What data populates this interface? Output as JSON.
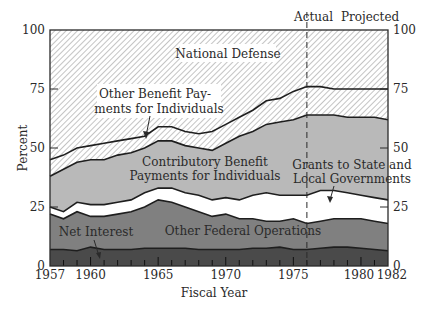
{
  "chart_data": {
    "type": "area",
    "stacked": true,
    "title": "",
    "xlabel": "Fiscal Year",
    "ylabel": "Percent",
    "xlim": [
      1957,
      1982
    ],
    "ylim": [
      0,
      100
    ],
    "x_ticks": [
      1957,
      1960,
      1965,
      1970,
      1975,
      1980,
      1982
    ],
    "y_ticks": [
      0,
      25,
      50,
      75,
      100
    ],
    "y_ticks_right": [
      0,
      25,
      50,
      75,
      100
    ],
    "grid": false,
    "legend_position": "inline labels",
    "divider": {
      "year": 1976,
      "left_label": "Actual",
      "right_label": "Projected"
    },
    "x": [
      1957,
      1958,
      1959,
      1960,
      1961,
      1962,
      1963,
      1964,
      1965,
      1966,
      1967,
      1968,
      1969,
      1970,
      1971,
      1972,
      1973,
      1974,
      1975,
      1976,
      1977,
      1978,
      1979,
      1980,
      1981,
      1982
    ],
    "cumulative_tops": {
      "Net Interest": [
        7,
        7,
        6.5,
        8,
        7,
        7,
        7,
        7.5,
        7.5,
        7.5,
        7.5,
        7,
        7,
        7,
        7,
        7.5,
        7.5,
        8,
        7,
        7,
        7.5,
        8,
        8,
        7.5,
        7,
        6.5
      ],
      "Other Federal Operations": [
        22,
        20,
        23,
        21,
        21,
        22,
        23,
        25,
        28,
        27,
        25,
        23,
        21,
        22,
        20,
        20,
        19,
        19,
        20,
        18,
        19,
        20,
        20,
        20,
        19,
        18
      ],
      "Grants to State and Local Governments": [
        25,
        23,
        27,
        26,
        26,
        27,
        28,
        31,
        33,
        33,
        31,
        30,
        28,
        29,
        28,
        30,
        31,
        30,
        30,
        30,
        32,
        32,
        31,
        30,
        29,
        28
      ],
      "Contributory Benefit Payments for Individuals": [
        38,
        41,
        44,
        45,
        45,
        47,
        48,
        50,
        53,
        53,
        51,
        50,
        49,
        52,
        55,
        57,
        60,
        61,
        62,
        64,
        64,
        64,
        63,
        63,
        63,
        62
      ],
      "Other Benefit Payments for Individuals": [
        45,
        47,
        50,
        51,
        52,
        53,
        54,
        55,
        59,
        59,
        57,
        56,
        57,
        60,
        63,
        66,
        70,
        71,
        74,
        76,
        76,
        75,
        75,
        75,
        75,
        75
      ],
      "National Defense": [
        100,
        100,
        100,
        100,
        100,
        100,
        100,
        100,
        100,
        100,
        100,
        100,
        100,
        100,
        100,
        100,
        100,
        100,
        100,
        100,
        100,
        100,
        100,
        100,
        100,
        100
      ]
    },
    "series": [
      {
        "name": "Net Interest",
        "fill": "#4a4a4a"
      },
      {
        "name": "Other Federal Operations",
        "fill": "#808080"
      },
      {
        "name": "Grants to State and Local Governments",
        "fill": "#ffffff"
      },
      {
        "name": "Contributory Benefit Payments for Individuals",
        "fill": "#b9b9b9"
      },
      {
        "name": "Other Benefit Payments for Individuals",
        "fill": "hatch"
      },
      {
        "name": "National Defense",
        "fill": "hatch"
      }
    ]
  },
  "labels": {
    "actual": "Actual",
    "projected": "Projected",
    "national_defense": "National Defense",
    "other_benefit_l1": "Other Benefit Pay-",
    "other_benefit_l2": "ments for Individuals",
    "contributory_l1": "Contributory Benefit",
    "contributory_l2": "Payments for Individuals",
    "grants_l1": "Grants to State and",
    "grants_l2": "Local Governments",
    "other_federal": "Other Federal Operations",
    "net_interest": "Net Interest",
    "xlabel": "Fiscal Year",
    "ylabel": "Percent"
  }
}
